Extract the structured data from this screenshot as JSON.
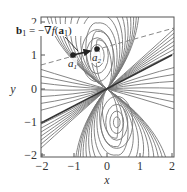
{
  "figure": {
    "annotation_label": "b₁ = −∇f(a₁)",
    "annotation_parts": {
      "b": "b",
      "sub1": "1",
      "eq": " = −∇",
      "f": "f",
      "open": "(",
      "a": "a",
      "sub2": "1",
      "close": ")"
    },
    "x_axis_label": "x",
    "y_axis_label": "y",
    "x_ticks": [
      "−2",
      "−1",
      "0",
      "1",
      "2"
    ],
    "y_ticks": [
      "2",
      "1",
      "0",
      "−1",
      "−2"
    ],
    "points": [
      {
        "name": "a",
        "sub": "1",
        "x": -1.0,
        "y": 1.0
      },
      {
        "name": "a",
        "sub": "2",
        "x": -0.3,
        "y": 1.15
      }
    ],
    "colors": {
      "contour": "#777777",
      "frame": "#555555",
      "solid_line": "#333333",
      "dashed_line": "#888888",
      "point": "#222222"
    }
  },
  "chart_data": {
    "type": "contour",
    "title": "",
    "xlabel": "x",
    "ylabel": "y",
    "xlim": [
      -2,
      2
    ],
    "ylim": [
      -2,
      2
    ],
    "x_tick_labels": [
      "-2",
      "-1",
      "0",
      "1",
      "2"
    ],
    "y_tick_labels": [
      "-2",
      "-1",
      "0",
      "1",
      "2"
    ],
    "extrema": [
      {
        "x": -0.3,
        "y": 1.0,
        "kind": "upper elliptical center"
      },
      {
        "x": 0.3,
        "y": -1.0,
        "kind": "lower elliptical center"
      }
    ],
    "solid_line": {
      "from": [
        -2,
        -1.0
      ],
      "to": [
        2,
        1.0
      ]
    },
    "dashed_line": {
      "from": [
        -2,
        0.7
      ],
      "to": [
        2,
        1.8
      ]
    },
    "points": [
      {
        "label": "a1",
        "x": -1.0,
        "y": 1.0
      },
      {
        "label": "a2",
        "x": -0.3,
        "y": 1.15
      }
    ],
    "arrow": {
      "from": [
        -1.0,
        1.0
      ],
      "to": [
        -0.45,
        1.12
      ],
      "label": "b1 = -∇f(a1)"
    },
    "grid": false
  }
}
